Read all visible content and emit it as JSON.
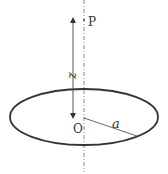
{
  "diagram": {
    "title": "",
    "labels": {
      "point_p": "P",
      "origin": "O",
      "height": "z",
      "radius": "a"
    },
    "shapes": {
      "axis": {
        "style": "dash-dot",
        "x": 84,
        "y1": 0,
        "y2": 172
      },
      "ring": {
        "type": "ellipse",
        "cx": 84,
        "cy": 117,
        "rx": 74,
        "ry": 28
      },
      "height_arrow": {
        "x": 73,
        "y1": 18,
        "y2": 118,
        "double_headed": true
      },
      "radius_line": {
        "x1": 84,
        "y1": 118,
        "x2": 137,
        "y2": 136
      }
    },
    "colors": {
      "stroke": "#333333",
      "axis": "#888888",
      "background": "#ffffff"
    }
  }
}
